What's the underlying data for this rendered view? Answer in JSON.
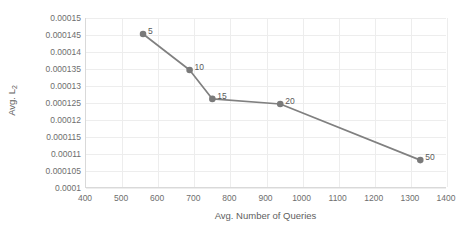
{
  "chart_data": {
    "type": "line",
    "title": "",
    "xlabel": "Avg. Number of Queries",
    "ylabel": "Avg. L2",
    "ylabel_base": "Avg. L",
    "ylabel_sub": "2",
    "xlim": [
      400,
      1400
    ],
    "ylim": [
      0.0001,
      0.00015
    ],
    "grid": true,
    "legend": "none",
    "xticks": [
      400,
      500,
      600,
      700,
      800,
      900,
      1000,
      1100,
      1200,
      1300,
      1400
    ],
    "xticklabels": [
      "400",
      "500",
      "600",
      "700",
      "800",
      "900",
      "1000",
      "1100",
      "1200",
      "1300",
      "1400"
    ],
    "yticks": [
      0.0001,
      0.000105,
      0.00011,
      0.000115,
      0.00012,
      0.000125,
      0.00013,
      0.000135,
      0.00014,
      0.000145,
      0.00015
    ],
    "yticklabels": [
      "0.0001",
      "0.000105",
      "0.00011",
      "0.000115",
      "0.00012",
      "0.000125",
      "0.00013",
      "0.000135",
      "0.00014",
      "0.000145",
      "0.00015"
    ],
    "series": [
      {
        "name": "Avg. L2 vs Avg. Number of Queries",
        "color": "#808080",
        "marker": "circle",
        "points": [
          {
            "label": "5",
            "x": 558,
            "y": 0.0001453
          },
          {
            "label": "10",
            "x": 687,
            "y": 0.0001347
          },
          {
            "label": "15",
            "x": 750,
            "y": 0.0001262
          },
          {
            "label": "20",
            "x": 938,
            "y": 0.0001247
          },
          {
            "label": "50",
            "x": 1326,
            "y": 0.0001082
          }
        ]
      }
    ],
    "annotations": [
      {
        "text": "5",
        "for_point": 0
      },
      {
        "text": "10",
        "for_point": 1
      },
      {
        "text": "15",
        "for_point": 2
      },
      {
        "text": "20",
        "for_point": 3
      },
      {
        "text": "50",
        "for_point": 4
      }
    ],
    "colors": {
      "line": "#808080",
      "marker": "#7a7a7a",
      "grid": "#ededed",
      "axis": "#d9d9d9",
      "tick_text": "#6e6e6e",
      "title_text": "#606060",
      "label_text": "#5a5a5a",
      "background": "#ffffff"
    }
  }
}
